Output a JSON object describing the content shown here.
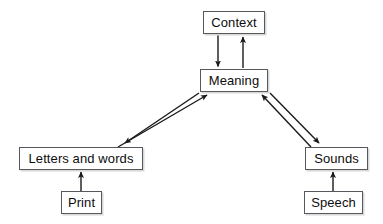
{
  "diagram": {
    "background_color": "#ffffff",
    "box_border_color": "#55585c",
    "box_fill_color": "#ffffff",
    "text_color": "#0d0d0d",
    "arrow_color": "#1a1a1a",
    "nodes": [
      {
        "id": "context",
        "label": "Context",
        "x": 203,
        "y": 11,
        "w": 62,
        "h": 23
      },
      {
        "id": "meaning",
        "label": "Meaning",
        "x": 200,
        "y": 69,
        "w": 68,
        "h": 23
      },
      {
        "id": "letters_and_words",
        "label": "Letters and words",
        "x": 19,
        "y": 147,
        "w": 124,
        "h": 23
      },
      {
        "id": "sounds",
        "label": "Sounds",
        "x": 305,
        "y": 147,
        "w": 63,
        "h": 23
      },
      {
        "id": "print",
        "label": "Print",
        "x": 61,
        "y": 191,
        "w": 41,
        "h": 23
      },
      {
        "id": "speech",
        "label": "Speech",
        "x": 304,
        "y": 191,
        "w": 59,
        "h": 23
      }
    ],
    "edges": [
      {
        "id": "context-to-meaning",
        "from": "Context",
        "to": "Meaning",
        "direction": "down"
      },
      {
        "id": "meaning-to-context",
        "from": "Meaning",
        "to": "Context",
        "direction": "up"
      },
      {
        "id": "meaning-to-letters",
        "from": "Meaning",
        "to": "Letters and words",
        "direction": "down-left"
      },
      {
        "id": "letters-to-meaning",
        "from": "Letters and words",
        "to": "Meaning",
        "direction": "up-right"
      },
      {
        "id": "meaning-to-sounds",
        "from": "Meaning",
        "to": "Sounds",
        "direction": "down-right"
      },
      {
        "id": "sounds-to-meaning",
        "from": "Sounds",
        "to": "Meaning",
        "direction": "up-left"
      },
      {
        "id": "print-to-letters",
        "from": "Print",
        "to": "Letters and words",
        "direction": "up"
      },
      {
        "id": "speech-to-sounds",
        "from": "Speech",
        "to": "Sounds",
        "direction": "up"
      }
    ]
  }
}
